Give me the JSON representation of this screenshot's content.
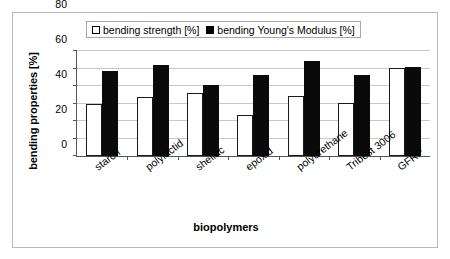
{
  "chart_data": {
    "type": "bar",
    "title": "",
    "xlabel": "biopolymers",
    "ylabel": "bending properties [%]",
    "categories": [
      "starch",
      "polylactid",
      "shellac",
      "epoxid",
      "polyurethane",
      "Tribest 3006",
      "GFRP"
    ],
    "series": [
      {
        "name": "bending strength [%]",
        "style": "open",
        "color": "#ffffff",
        "edge_color": "#000000",
        "values": [
          60,
          68,
          72,
          47,
          69,
          61,
          101
        ]
      },
      {
        "name": "bending Young's Modulus [%]",
        "style": "filled",
        "color": "#000000",
        "edge_color": "#000000",
        "values": [
          97,
          104,
          81,
          93,
          109,
          93,
          102
        ]
      }
    ],
    "ylim": [
      0,
      120
    ],
    "yticks": [
      0,
      20,
      40,
      60,
      80,
      100,
      120
    ],
    "ytick_labels": [
      "0",
      "20",
      "40",
      "60",
      "80",
      "100",
      "120"
    ],
    "grid": true,
    "grid_axis": "y",
    "grid_color": "#c8c8c8",
    "legend_position": "top-center",
    "xtick_label_rotation": -37,
    "frame": true,
    "frame_color": "#b9b9b9",
    "axis_color": "#555555"
  },
  "legend": {
    "entries": [
      {
        "label": "bending strength [%]",
        "swatch": "open-square-icon"
      },
      {
        "label": "bending Young's Modulus [%]",
        "swatch": "filled-square-icon"
      }
    ]
  },
  "axes": {
    "y_title": "bending properties [%]",
    "x_title": "biopolymers"
  }
}
